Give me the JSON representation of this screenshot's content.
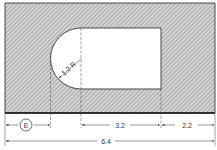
{
  "drawing": {
    "colors": {
      "line": "#222222",
      "hatch": "#8a8a8a",
      "background": "#ffffff",
      "hatch_fill": "#cfcfcf"
    },
    "plate": {
      "label": "plate-outline"
    },
    "cutout": {
      "label": "slot-cutout"
    },
    "radius_label": "1.2 R",
    "dimensions": {
      "e_label": "E",
      "slot_length": "3.2",
      "right_margin": "2.2",
      "overall_width": "6.4"
    }
  }
}
